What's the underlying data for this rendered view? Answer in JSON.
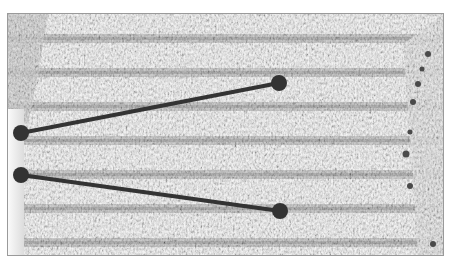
{
  "image": {
    "subject": "knitted fabric swatch with horizontal textured stripes",
    "palette": {
      "light": "#f2f2f2",
      "mid": "#c8c8c8",
      "dark": "#7a7a7a",
      "frame": "#9a9a9a"
    }
  },
  "annotations": {
    "color": "#333333",
    "line_width": 4,
    "dot_radius": 8,
    "lines": [
      {
        "from": [
          21,
          133
        ],
        "to": [
          279,
          83
        ]
      },
      {
        "from": [
          21,
          175
        ],
        "to": [
          280,
          211
        ]
      }
    ]
  }
}
